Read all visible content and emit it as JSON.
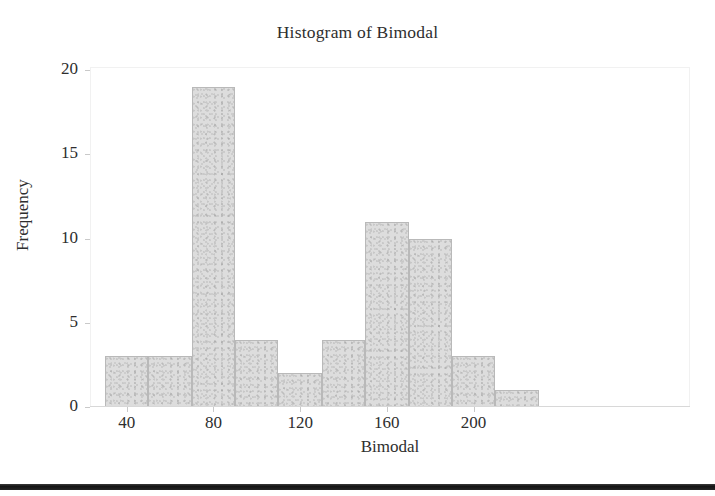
{
  "chart_data": {
    "type": "bar",
    "title": "Histogram of Bimodal",
    "xlabel": "Bimodal",
    "ylabel": "Frequency",
    "xlim": [
      30,
      250
    ],
    "ylim": [
      0,
      20
    ],
    "grid": false,
    "legend": null,
    "bin_width": 20,
    "bin_edges": [
      30,
      50,
      70,
      90,
      110,
      130,
      150,
      170,
      190,
      210,
      230,
      250
    ],
    "categories": [
      "30-50",
      "50-70",
      "70-90",
      "90-110",
      "110-130",
      "130-150",
      "150-170",
      "170-190",
      "190-210",
      "210-230",
      "230-250"
    ],
    "values": [
      3,
      3,
      19,
      4,
      2,
      4,
      11,
      10,
      3,
      1,
      0
    ],
    "bars": [
      {
        "x0": 30,
        "x1": 50,
        "value": 3
      },
      {
        "x0": 50,
        "x1": 70,
        "value": 3
      },
      {
        "x0": 70,
        "x1": 90,
        "value": 19
      },
      {
        "x0": 90,
        "x1": 110,
        "value": 4
      },
      {
        "x0": 110,
        "x1": 130,
        "value": 2
      },
      {
        "x0": 130,
        "x1": 150,
        "value": 4
      },
      {
        "x0": 150,
        "x1": 170,
        "value": 11
      },
      {
        "x0": 170,
        "x1": 190,
        "value": 10
      },
      {
        "x0": 190,
        "x1": 210,
        "value": 3
      },
      {
        "x0": 210,
        "x1": 230,
        "value": 1
      }
    ],
    "xticks": [
      40,
      80,
      120,
      160,
      200
    ],
    "xtick_labels": [
      "40",
      "80",
      "120",
      "160",
      "200"
    ],
    "yticks": [
      0,
      5,
      10,
      15,
      20
    ],
    "ytick_labels": [
      "0",
      "5",
      "10",
      "15",
      "20"
    ],
    "colors": {
      "bar_fill": "#dddddd",
      "bar_edge": "#b9b9b9",
      "text": "#2e2e2e",
      "axis": "#d8d8d8",
      "background": "#ffffff"
    }
  }
}
